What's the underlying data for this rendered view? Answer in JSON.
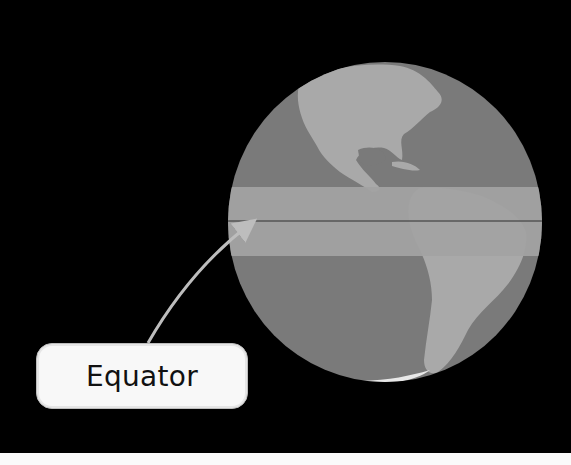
{
  "diagram": {
    "label": "Equator",
    "colors": {
      "background": "#000000",
      "ocean": "#7a7a7a",
      "land": "#a9a9a9",
      "equator_band": "#a2a2a2",
      "equator_line": "#555555",
      "arrow": "#bdbdbd",
      "label_box": "#f8f8f8"
    }
  }
}
